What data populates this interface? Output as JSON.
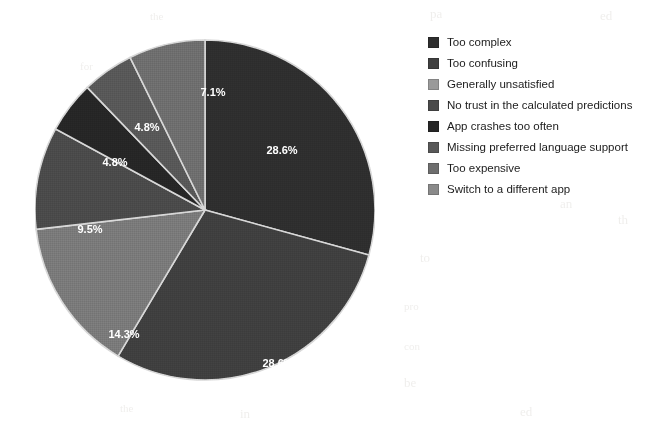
{
  "chart_data": {
    "type": "pie",
    "title": "",
    "labels": [
      "Too complex",
      "Too confusing",
      "Generally unsatisfied",
      "No trust in the calculated predictions",
      "App crashes too often",
      "Missing preferred language support",
      "Too expensive",
      "Switch to a different app"
    ],
    "values": [
      28.6,
      28.6,
      14.3,
      9.5,
      4.8,
      4.8,
      7.1,
      0
    ],
    "value_labels": [
      "28.6%",
      "28.6%",
      "14.3%",
      "9.5%",
      "4.8%",
      "4.8%",
      "7.1%",
      ""
    ],
    "colors": [
      "#2e2e2e",
      "#3f3f3f",
      "#7a7a7a",
      "#4a4a4a",
      "#262626",
      "#585858",
      "#6e6e6e",
      "#8a8a8a"
    ],
    "unit": "%",
    "legend_position": "right",
    "grid": false,
    "start_angle_deg": 0,
    "direction": "clockwise"
  },
  "legend": {
    "items": [
      {
        "label": "Too complex",
        "color": "#2e2e2e"
      },
      {
        "label": "Too confusing",
        "color": "#3f3f3f"
      },
      {
        "label": "Generally unsatisfied",
        "color": "#9a9a9a"
      },
      {
        "label": "No trust in the calculated predictions",
        "color": "#4a4a4a"
      },
      {
        "label": "App crashes too often",
        "color": "#262626"
      },
      {
        "label": "Missing preferred language support",
        "color": "#585858"
      },
      {
        "label": "Too expensive",
        "color": "#6e6e6e"
      },
      {
        "label": "Switch to a different app",
        "color": "#8a8a8a"
      }
    ]
  },
  "slices": [
    {
      "label": "Too complex",
      "percent_text": "28.6%",
      "value": 28.6,
      "color": "#2e2e2e",
      "label_x": 247,
      "label_y": 127
    },
    {
      "label": "Too confusing",
      "percent_text": "28.6%",
      "value": 28.6,
      "color": "#3f3f3f",
      "label_x": 243,
      "label_y": 340
    },
    {
      "label": "Generally unsatisfied",
      "percent_text": "14.3%",
      "value": 14.3,
      "color": "#7a7a7a",
      "label_x": 89,
      "label_y": 311
    },
    {
      "label": "No trust in the calculated predictions",
      "percent_text": "9.5%",
      "value": 9.5,
      "color": "#4a4a4a",
      "label_x": 55,
      "label_y": 206
    },
    {
      "label": "App crashes too often",
      "percent_text": "4.8%",
      "value": 4.8,
      "color": "#262626",
      "label_x": 80,
      "label_y": 139
    },
    {
      "label": "Missing preferred language support",
      "percent_text": "4.8%",
      "value": 4.8,
      "color": "#585858",
      "label_x": 112,
      "label_y": 104
    },
    {
      "label": "Too expensive",
      "percent_text": "7.1%",
      "value": 7.1,
      "color": "#6e6e6e",
      "label_x": 178,
      "label_y": 69
    }
  ],
  "background_ghost_text": [
    {
      "text": "the",
      "x": 150,
      "y": 10
    },
    {
      "text": "pa",
      "x": 430,
      "y": 6
    },
    {
      "text": "ed",
      "x": 600,
      "y": 8
    },
    {
      "text": "for",
      "x": 80,
      "y": 60
    },
    {
      "text": "an",
      "x": 560,
      "y": 196
    },
    {
      "text": "th",
      "x": 618,
      "y": 212
    },
    {
      "text": "to",
      "x": 420,
      "y": 250
    },
    {
      "text": "pro",
      "x": 404,
      "y": 300
    },
    {
      "text": "con",
      "x": 404,
      "y": 340
    },
    {
      "text": "be",
      "x": 404,
      "y": 375
    },
    {
      "text": "the",
      "x": 120,
      "y": 402
    },
    {
      "text": "in",
      "x": 240,
      "y": 406
    },
    {
      "text": "ed",
      "x": 520,
      "y": 404
    }
  ]
}
